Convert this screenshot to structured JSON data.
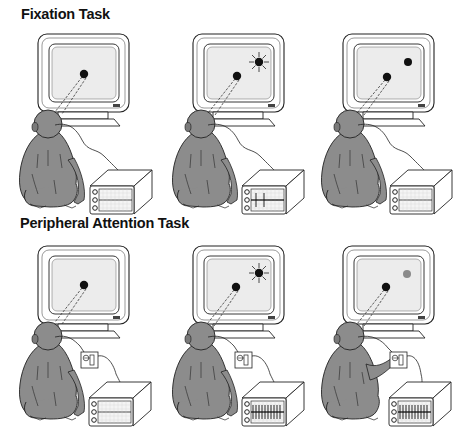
{
  "figure": {
    "sections": [
      {
        "title": "Fixation Task",
        "panels": [
          {
            "stimuli": [
              {
                "type": "fixation-point",
                "color": "#111111"
              }
            ],
            "lever": false,
            "spikes": "none"
          },
          {
            "stimuli": [
              {
                "type": "fixation-point",
                "color": "#111111"
              },
              {
                "type": "flashing-target",
                "color": "#111111"
              }
            ],
            "lever": false,
            "spikes": "few"
          },
          {
            "stimuli": [
              {
                "type": "fixation-point",
                "color": "#111111"
              },
              {
                "type": "target",
                "color": "#111111"
              }
            ],
            "lever": false,
            "spikes": "none"
          }
        ]
      },
      {
        "title": "Peripheral Attention Task",
        "panels": [
          {
            "stimuli": [
              {
                "type": "fixation-point",
                "color": "#111111"
              }
            ],
            "lever": true,
            "spikes": "none"
          },
          {
            "stimuli": [
              {
                "type": "fixation-point",
                "color": "#111111"
              },
              {
                "type": "flashing-target",
                "color": "#111111"
              }
            ],
            "lever": true,
            "spikes": "many"
          },
          {
            "stimuli": [
              {
                "type": "fixation-point",
                "color": "#111111"
              },
              {
                "type": "dimmed-target",
                "color": "#8a8a8a"
              }
            ],
            "lever": true,
            "lever_pressed": true,
            "spikes": "many"
          }
        ]
      }
    ],
    "colors": {
      "monkey": "#8c8c8c",
      "screen": "#ececec",
      "outline": "#222222",
      "dimmed_target": "#8a8a8a"
    }
  }
}
